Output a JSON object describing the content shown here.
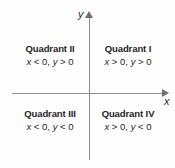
{
  "figure": {
    "axes": {
      "x_label": "x",
      "y_label": "y",
      "axis_color": "#8d8d8d",
      "arrow_color": "#6f6f6f"
    },
    "text_color": "#1f1f1f",
    "background": "#fefefe"
  },
  "quadrants": [
    {
      "id": "quadrant-1",
      "title": "Quadrant I",
      "x_sign": "x > 0",
      "y_sign": "y > 0",
      "condition": "x > 0, y > 0"
    },
    {
      "id": "quadrant-2",
      "title": "Quadrant II",
      "x_sign": "x < 0",
      "y_sign": "y > 0",
      "condition": "x < 0, y > 0"
    },
    {
      "id": "quadrant-3",
      "title": "Quadrant III",
      "x_sign": "x < 0",
      "y_sign": "y < 0",
      "condition": "x < 0, y < 0"
    },
    {
      "id": "quadrant-4",
      "title": "Quadrant IV",
      "x_sign": "x > 0",
      "y_sign": "y < 0",
      "condition": "x > 0, y < 0"
    }
  ],
  "chart_data": {
    "type": "scatter",
    "xlabel": "x",
    "ylabel": "y",
    "xlim": [
      -1,
      1
    ],
    "ylim": [
      -1,
      1
    ],
    "grid": false,
    "legend": null,
    "annotations": [
      {
        "text": "Quadrant II\nx < 0, y > 0",
        "x": -0.5,
        "y": 0.55
      },
      {
        "text": "Quadrant I\nx > 0, y > 0",
        "x": 0.5,
        "y": 0.55
      },
      {
        "text": "Quadrant III\nx < 0, y < 0",
        "x": -0.5,
        "y": -0.45
      },
      {
        "text": "Quadrant IV\nx > 0, y < 0",
        "x": 0.5,
        "y": -0.45
      }
    ],
    "series": []
  }
}
